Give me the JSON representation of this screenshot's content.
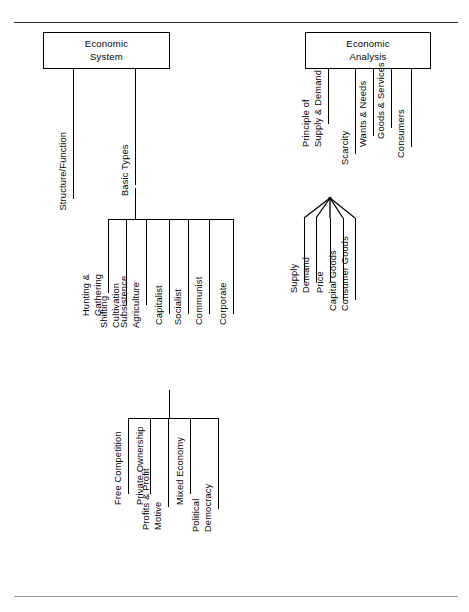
{
  "diagram": {
    "title_nodes": {
      "economic_system": {
        "line1": "Economic",
        "line2": "System"
      },
      "economic_analysis": {
        "line1": "Economic",
        "line2": "Analysis"
      }
    },
    "left_branch_labels": {
      "structure_function": "Structure/Function",
      "basic_types": "Basic Types"
    },
    "basic_types_children": [
      {
        "line1": "Hunting &",
        "line2": "Gathering"
      },
      {
        "line1": "Shifting",
        "line2": "Cultivation"
      },
      {
        "line1": "Subsistence",
        "line2": "Agriculture"
      },
      {
        "line1": "Capitalist",
        "line2": ""
      },
      {
        "line1": "Socialist",
        "line2": ""
      },
      {
        "line1": "Communist",
        "line2": ""
      },
      {
        "line1": "Corporate",
        "line2": ""
      }
    ],
    "capitalist_attributes": [
      {
        "line1": "Free Competition",
        "line2": ""
      },
      {
        "line1": "Private Ownership",
        "line2": ""
      },
      {
        "line1": "Profits & Profit",
        "line2": "Motive"
      },
      {
        "line1": "Mixed Economy",
        "line2": ""
      },
      {
        "line1": "Political",
        "line2": "Democracy"
      }
    ],
    "analysis_children": [
      {
        "line1": "Principle of",
        "line2": "Supply & Demand"
      },
      {
        "line1": "Scarcity",
        "line2": ""
      },
      {
        "line1": "Wants & Needs",
        "line2": ""
      },
      {
        "line1": "Goods & Services",
        "line2": ""
      },
      {
        "line1": "Consumers",
        "line2": ""
      }
    ],
    "supply_demand_children": [
      {
        "line1": "Supply",
        "line2": ""
      },
      {
        "line1": "Demand",
        "line2": ""
      },
      {
        "line1": "Price",
        "line2": ""
      },
      {
        "line1": "Capital Goods",
        "line2": ""
      },
      {
        "line1": "Consumer Goods",
        "line2": ""
      }
    ],
    "colors": {
      "ink": "#000000",
      "rule": "#2b2b2b",
      "paper": "#ffffff"
    }
  }
}
